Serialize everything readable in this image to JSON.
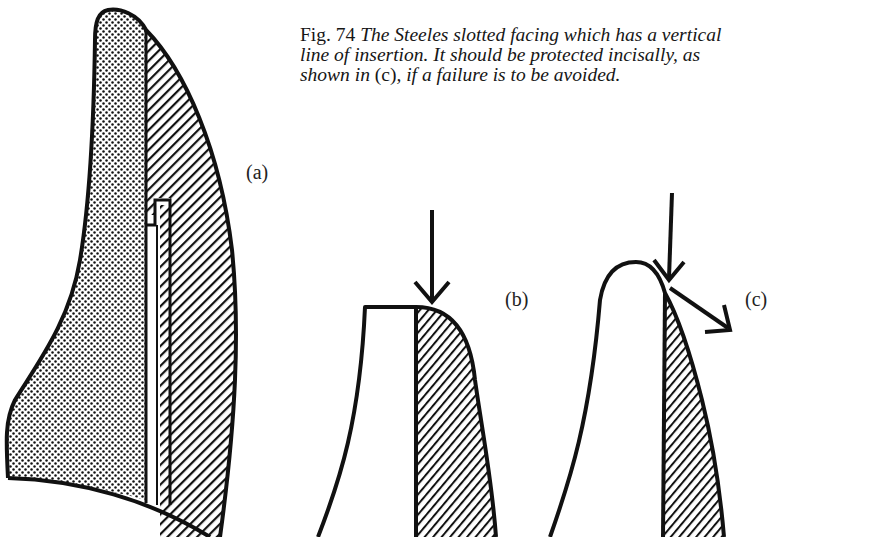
{
  "caption": {
    "figure_number": "Fig. 74",
    "line1": " The Steeles slotted facing which has a vertical",
    "line2": "line of insertion. It should be protected incisally, as",
    "line3_part1": "shown in ",
    "line3_ref": "(c)",
    "line3_part2": ", if a failure is to be avoided."
  },
  "panels": {
    "a": {
      "label": "(a)",
      "description": "Slotted facing cross-section: stippled backing, hatched porcelain facing, vertical slot/post"
    },
    "b": {
      "label": "(b)",
      "description": "Flat incisal edge with vertical occlusal force arrow at facing junction"
    },
    "c": {
      "label": "(c)",
      "description": "Rounded incisal edge protecting facing; vertical force arrow deflected outward"
    }
  },
  "colors": {
    "ink": "#111111",
    "paper": "#ffffff"
  }
}
